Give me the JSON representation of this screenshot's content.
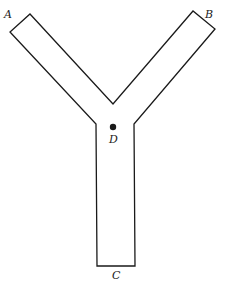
{
  "diagram": {
    "type": "Y-shaped channel",
    "labels": {
      "A": "A",
      "B": "B",
      "C": "C",
      "D": "D"
    },
    "colors": {
      "stroke": "#1a1a1a",
      "background": "#ffffff"
    }
  }
}
